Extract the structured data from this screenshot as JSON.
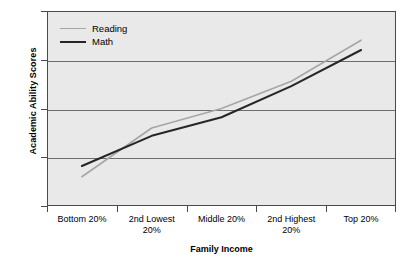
{
  "chart_data": {
    "type": "line",
    "title": "",
    "xlabel": "Family Income",
    "ylabel": "Academic Ability Scores",
    "categories": [
      "Bottom 20%",
      "2nd Lowest 20%",
      "Middle 20%",
      "2nd Highest 20%",
      "Top 20%"
    ],
    "series": [
      {
        "name": "Reading",
        "color": "#a6a6a6",
        "values": [
          43.0,
          48.0,
          50.0,
          52.8,
          57.0
        ]
      },
      {
        "name": "Math",
        "color": "#262626",
        "values": [
          44.1,
          47.2,
          49.1,
          52.3,
          56.0
        ]
      }
    ],
    "ylim": [
      40,
      60
    ],
    "yticks": [
      40,
      45,
      50,
      55,
      60
    ],
    "ytick_labels": [
      "40",
      "45",
      "50",
      "55",
      "60"
    ],
    "grid": true,
    "legend_position": "top-left",
    "plot_background": "#e9e9e9"
  },
  "axes": {
    "y_title": "Academic Ability Scores",
    "x_title": "Family Income",
    "y_tick_labels": [
      "60",
      "55",
      "50",
      "45",
      "40"
    ],
    "x_category_lines": [
      [
        "Bottom 20%"
      ],
      [
        "2nd Lowest",
        "20%"
      ],
      [
        "Middle 20%"
      ],
      [
        "2nd Highest",
        "20%"
      ],
      [
        "Top 20%"
      ]
    ]
  },
  "legend": {
    "entries": [
      {
        "label": "Reading"
      },
      {
        "label": "Math"
      }
    ]
  }
}
